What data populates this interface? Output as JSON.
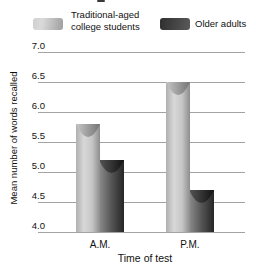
{
  "legend": {
    "items": [
      {
        "label": "Traditional-aged college students",
        "swatch": "light"
      },
      {
        "label": "Older adults",
        "swatch": "dark"
      }
    ]
  },
  "chart_data": {
    "type": "bar",
    "categories": [
      "A.M.",
      "P.M."
    ],
    "series": [
      {
        "name": "Traditional-aged college students",
        "values": [
          5.8,
          6.5
        ]
      },
      {
        "name": "Older adults",
        "values": [
          5.2,
          4.7
        ]
      }
    ],
    "ylabel": "Mean number of words recalled",
    "xlabel": "Time of test",
    "ylim": [
      4.0,
      7.0
    ],
    "yticks": [
      7.0,
      6.5,
      6.0,
      5.5,
      5.0,
      4.5,
      4.0
    ],
    "grid": true,
    "legend_position": "top",
    "bar_style": "3d-cylinder"
  },
  "colors": {
    "light_bar_gradient": [
      "#b0b0b0",
      "#d8d8d8",
      "#c6c6c6",
      "#8d8d8d"
    ],
    "light_cap_gradient": [
      "#c6c6c6",
      "#747474"
    ],
    "dark_bar_gradient": [
      "#8c8c8c",
      "#555555",
      "#262626"
    ],
    "dark_cap_gradient": [
      "#555555",
      "#111111"
    ],
    "gridline": "#a3a3a3",
    "text": "#111111"
  }
}
